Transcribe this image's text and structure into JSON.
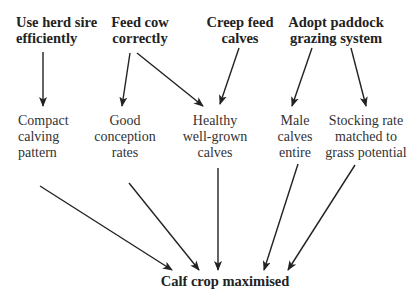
{
  "diagram": {
    "type": "flow",
    "colors": {
      "text": "#222222",
      "arrow": "#222222",
      "background": "#ffffff"
    },
    "top_nodes": [
      {
        "id": "herd-sire",
        "lines": [
          "Use herd sire",
          "efficiently"
        ]
      },
      {
        "id": "feed-cow",
        "lines": [
          "Feed cow",
          "correctly"
        ]
      },
      {
        "id": "creep-feed",
        "lines": [
          "Creep feed",
          "calves"
        ]
      },
      {
        "id": "paddock-grazing",
        "lines": [
          "Adopt paddock",
          "grazing system"
        ]
      }
    ],
    "middle_nodes": [
      {
        "id": "compact-calving",
        "lines": [
          "Compact",
          "calving",
          "pattern"
        ]
      },
      {
        "id": "good-conception",
        "lines": [
          "Good",
          "conception",
          "rates"
        ]
      },
      {
        "id": "healthy-calves",
        "lines": [
          "Healthy",
          "well-grown",
          "calves"
        ]
      },
      {
        "id": "male-calves",
        "lines": [
          "Male",
          "calves",
          "entire"
        ]
      },
      {
        "id": "stocking-rate",
        "lines": [
          "Stocking rate",
          "matched to",
          "grass potential"
        ]
      }
    ],
    "bottom_node": {
      "id": "calf-crop",
      "label": "Calf crop maximised"
    },
    "edges": [
      {
        "from": "herd-sire",
        "to": "compact-calving"
      },
      {
        "from": "feed-cow",
        "to": "good-conception"
      },
      {
        "from": "feed-cow",
        "to": "healthy-calves"
      },
      {
        "from": "creep-feed",
        "to": "healthy-calves"
      },
      {
        "from": "paddock-grazing",
        "to": "male-calves"
      },
      {
        "from": "paddock-grazing",
        "to": "stocking-rate"
      },
      {
        "from": "compact-calving",
        "to": "calf-crop"
      },
      {
        "from": "good-conception",
        "to": "calf-crop"
      },
      {
        "from": "healthy-calves",
        "to": "calf-crop"
      },
      {
        "from": "male-calves",
        "to": "calf-crop"
      },
      {
        "from": "stocking-rate",
        "to": "calf-crop"
      }
    ]
  }
}
